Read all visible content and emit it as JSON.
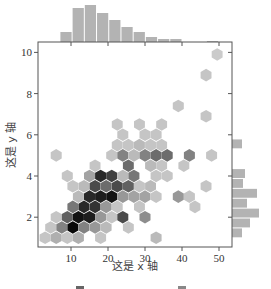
{
  "chart_data": {
    "type": "hexbin",
    "title": "",
    "xlabel": "这是 x 轴",
    "ylabel": "这是 y 轴",
    "caption_partial": "图 …（caption cut off at bottom edge）",
    "xlim": [
      0,
      53
    ],
    "ylim": [
      0.5,
      10.5
    ],
    "xticks": [
      10,
      20,
      30,
      40,
      50
    ],
    "yticks": [
      2,
      4,
      6,
      8,
      10
    ],
    "grid": false,
    "colormap": "Greys",
    "hexbins": [
      {
        "x": 3,
        "y": 1.0,
        "d": 0.15
      },
      {
        "x": 6,
        "y": 1.0,
        "d": 0.25
      },
      {
        "x": 9,
        "y": 1.0,
        "d": 0.15
      },
      {
        "x": 12,
        "y": 1.0,
        "d": 0.25
      },
      {
        "x": 18,
        "y": 1.0,
        "d": 0.15
      },
      {
        "x": 33,
        "y": 1.0,
        "d": 0.2
      },
      {
        "x": 4.5,
        "y": 1.5,
        "d": 0.15
      },
      {
        "x": 7.5,
        "y": 1.5,
        "d": 0.45
      },
      {
        "x": 10.5,
        "y": 1.5,
        "d": 1.0
      },
      {
        "x": 13.5,
        "y": 1.5,
        "d": 0.45
      },
      {
        "x": 16.5,
        "y": 1.5,
        "d": 0.35
      },
      {
        "x": 19.5,
        "y": 1.5,
        "d": 0.2
      },
      {
        "x": 25.5,
        "y": 1.5,
        "d": 0.15
      },
      {
        "x": 6,
        "y": 2.0,
        "d": 0.15
      },
      {
        "x": 9,
        "y": 2.0,
        "d": 0.6
      },
      {
        "x": 12,
        "y": 2.0,
        "d": 0.95
      },
      {
        "x": 15,
        "y": 2.0,
        "d": 0.9
      },
      {
        "x": 18,
        "y": 2.0,
        "d": 0.35
      },
      {
        "x": 21,
        "y": 2.0,
        "d": 0.15
      },
      {
        "x": 24,
        "y": 2.0,
        "d": 0.7
      },
      {
        "x": 30,
        "y": 2.0,
        "d": 0.4
      },
      {
        "x": 10.5,
        "y": 2.5,
        "d": 0.5
      },
      {
        "x": 13.5,
        "y": 2.5,
        "d": 0.85
      },
      {
        "x": 16.5,
        "y": 2.5,
        "d": 0.8
      },
      {
        "x": 19.5,
        "y": 2.5,
        "d": 0.35
      },
      {
        "x": 22.5,
        "y": 2.5,
        "d": 0.15
      },
      {
        "x": 28.5,
        "y": 2.5,
        "d": 0.15
      },
      {
        "x": 43.5,
        "y": 2.5,
        "d": 0.15
      },
      {
        "x": 12,
        "y": 3.0,
        "d": 0.2
      },
      {
        "x": 15,
        "y": 3.0,
        "d": 0.85
      },
      {
        "x": 18,
        "y": 3.0,
        "d": 0.9
      },
      {
        "x": 21,
        "y": 3.0,
        "d": 0.95
      },
      {
        "x": 24,
        "y": 3.0,
        "d": 0.35
      },
      {
        "x": 27,
        "y": 3.0,
        "d": 0.3
      },
      {
        "x": 30,
        "y": 3.0,
        "d": 0.3
      },
      {
        "x": 33,
        "y": 3.0,
        "d": 0.15
      },
      {
        "x": 39,
        "y": 3.0,
        "d": 0.35
      },
      {
        "x": 42,
        "y": 3.0,
        "d": 0.15
      },
      {
        "x": 10.5,
        "y": 3.5,
        "d": 0.15
      },
      {
        "x": 13.5,
        "y": 3.5,
        "d": 0.2
      },
      {
        "x": 16.5,
        "y": 3.5,
        "d": 0.7
      },
      {
        "x": 19.5,
        "y": 3.5,
        "d": 0.55
      },
      {
        "x": 22.5,
        "y": 3.5,
        "d": 0.7
      },
      {
        "x": 25.5,
        "y": 3.5,
        "d": 0.6
      },
      {
        "x": 28.5,
        "y": 3.5,
        "d": 0.15
      },
      {
        "x": 31.5,
        "y": 3.5,
        "d": 0.2
      },
      {
        "x": 46.5,
        "y": 3.5,
        "d": 0.15
      },
      {
        "x": 9,
        "y": 4.0,
        "d": 0.15
      },
      {
        "x": 15,
        "y": 4.0,
        "d": 0.3
      },
      {
        "x": 18,
        "y": 4.0,
        "d": 0.85
      },
      {
        "x": 21,
        "y": 4.0,
        "d": 0.75
      },
      {
        "x": 24,
        "y": 4.0,
        "d": 0.2
      },
      {
        "x": 27,
        "y": 4.0,
        "d": 0.5
      },
      {
        "x": 33,
        "y": 4.0,
        "d": 0.15
      },
      {
        "x": 36,
        "y": 4.0,
        "d": 0.15
      },
      {
        "x": 16.5,
        "y": 4.5,
        "d": 0.15
      },
      {
        "x": 25.5,
        "y": 4.5,
        "d": 0.55
      },
      {
        "x": 31.5,
        "y": 4.5,
        "d": 0.2
      },
      {
        "x": 34.5,
        "y": 4.5,
        "d": 0.15
      },
      {
        "x": 40.5,
        "y": 4.5,
        "d": 0.15
      },
      {
        "x": 6,
        "y": 5.0,
        "d": 0.15
      },
      {
        "x": 21,
        "y": 5.0,
        "d": 0.15
      },
      {
        "x": 24,
        "y": 5.0,
        "d": 0.45
      },
      {
        "x": 27,
        "y": 5.0,
        "d": 0.2
      },
      {
        "x": 30,
        "y": 5.0,
        "d": 0.45
      },
      {
        "x": 33,
        "y": 5.0,
        "d": 0.55
      },
      {
        "x": 36,
        "y": 5.0,
        "d": 0.55
      },
      {
        "x": 42,
        "y": 5.0,
        "d": 0.45
      },
      {
        "x": 48,
        "y": 5.0,
        "d": 0.15
      },
      {
        "x": 22.5,
        "y": 5.5,
        "d": 0.15
      },
      {
        "x": 25.5,
        "y": 5.5,
        "d": 0.15
      },
      {
        "x": 28.5,
        "y": 5.5,
        "d": 0.2
      },
      {
        "x": 31.5,
        "y": 5.5,
        "d": 0.15
      },
      {
        "x": 34.5,
        "y": 5.5,
        "d": 0.15
      },
      {
        "x": 24,
        "y": 6.0,
        "d": 0.15
      },
      {
        "x": 30,
        "y": 6.0,
        "d": 0.15
      },
      {
        "x": 33,
        "y": 6.0,
        "d": 0.15
      },
      {
        "x": 22.5,
        "y": 6.5,
        "d": 0.15
      },
      {
        "x": 28.5,
        "y": 6.5,
        "d": 0.15
      },
      {
        "x": 34.5,
        "y": 6.5,
        "d": 0.15
      },
      {
        "x": 46.5,
        "y": 6.9,
        "d": 0.15
      },
      {
        "x": 39,
        "y": 7.4,
        "d": 0.15
      },
      {
        "x": 46.5,
        "y": 8.9,
        "d": 0.15
      },
      {
        "x": 49.5,
        "y": 9.9,
        "d": 0.12
      }
    ],
    "marginal_x_hist": {
      "bin_edges": [
        7,
        10.3,
        13.6,
        16.9,
        20.2,
        23.5,
        26.8,
        30.1,
        33.4,
        36.7,
        40,
        43.3,
        46.6,
        49.9
      ],
      "heights": [
        10,
        34,
        37,
        29,
        22,
        15,
        10,
        5,
        3,
        3,
        0,
        0,
        1
      ]
    },
    "marginal_y_hist": {
      "bin_edges": [
        1.0,
        1.48,
        1.96,
        2.44,
        2.92,
        3.4,
        3.88,
        4.36,
        4.84,
        5.32,
        5.8
      ],
      "heights": [
        10,
        18,
        27,
        15,
        25,
        11,
        13,
        0,
        0,
        10
      ]
    }
  },
  "axes": {
    "x_tick_labels": [
      "10",
      "20",
      "30",
      "40",
      "50"
    ],
    "y_tick_labels": [
      "2",
      "4",
      "6",
      "8",
      "10"
    ]
  },
  "labels": {
    "xlabel": "这是 x 轴",
    "ylabel": "这是 y 轴"
  },
  "colors": {
    "hist": "#b3b3b3",
    "axis": "#555555",
    "hex_light": "#e0e0e0",
    "hex_dark": "#0a0a0a"
  }
}
